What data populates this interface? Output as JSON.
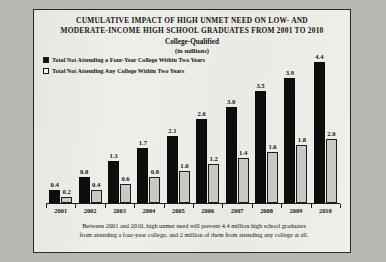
{
  "figure": {
    "title_line1": "CUMULATIVE  IMPACT OF HIGH UNMET NEED ON LOW- AND",
    "title_line2": "MODERATE-INCOME HIGH SCHOOL GRADUATES FROM 2001 TO 2010",
    "subtitle": "College-Qualified",
    "units": "(in millions)",
    "note_line1": "Between 2001 and 2010, high unmet need will prevent 4.4 million high school graduates",
    "note_line2": "from attending a four-year college, and 2 million of them from attending any college at all.",
    "colors": {
      "series1": "#0e0e0e",
      "series2": "#c9c8c3",
      "paper": "#efeee9",
      "ink": "#141414"
    }
  },
  "chart_data": {
    "type": "bar",
    "title": "CUMULATIVE  IMPACT OF HIGH UNMET NEED ON LOW- AND MODERATE-INCOME HIGH SCHOOL GRADUATES FROM 2001 TO 2010",
    "subtitle": "College-Qualified",
    "xlabel": "",
    "ylabel": "(in millions)",
    "ylim": [
      0,
      4.7
    ],
    "grid": false,
    "legend_position": "top-left",
    "categories": [
      "2001",
      "2002",
      "2003",
      "2004",
      "2005",
      "2006",
      "2007",
      "2008",
      "2009",
      "2010"
    ],
    "series": [
      {
        "name": "Total Not Attending a Four-Year College Within Two Years",
        "values": [
          0.4,
          0.8,
          1.3,
          1.7,
          2.1,
          2.6,
          3.0,
          3.5,
          3.9,
          4.4
        ],
        "labels": [
          "0.4",
          "0.8",
          "1.3",
          "1.7",
          "2.1",
          "2.6",
          "3.0",
          "3.5",
          "3.9",
          "4.4"
        ]
      },
      {
        "name": "Total Not Attending Any College Within Two Years",
        "values": [
          0.2,
          0.4,
          0.6,
          0.8,
          1.0,
          1.2,
          1.4,
          1.6,
          1.8,
          2.0
        ],
        "labels": [
          "0.2",
          "0.4",
          "0.6",
          "0.8",
          "1.0",
          "1.2",
          "1.4",
          "1.6",
          "1.8",
          "2.0"
        ]
      }
    ]
  }
}
